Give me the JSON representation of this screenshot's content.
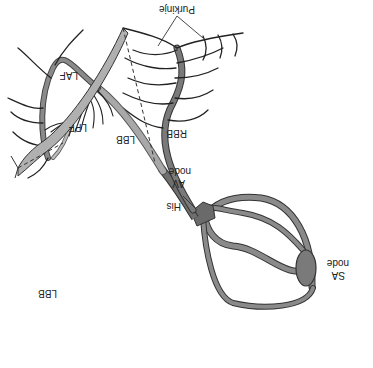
{
  "diagram": {
    "orientation": "upside-down",
    "labels": {
      "purkinje": "Purkinje",
      "laf": "LAF",
      "lpf": "LPF",
      "lbb_upper": "LBB",
      "rbb": "RBB",
      "av_node_line1": "AV",
      "av_node_line2": "node",
      "his": "His",
      "sa_node_line1": "SA",
      "sa_node_line2": "node",
      "lbb_lower": "LBB"
    },
    "colors": {
      "fiber_dark": "#555555",
      "fiber_mid": "#8a8a8a",
      "fiber_light": "#b0b0b0",
      "node_fill": "#7a7a7a",
      "outline": "#333333",
      "purkinje_line": "#222222",
      "background": "#ffffff"
    }
  }
}
